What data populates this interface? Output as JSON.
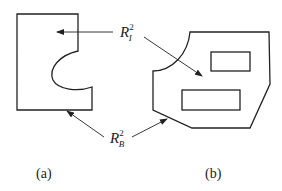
{
  "diagram": {
    "labels": {
      "interior": {
        "main": "R",
        "sub": "I",
        "sup": "2"
      },
      "boundary": {
        "main": "R",
        "sub": "B",
        "sup": "2"
      }
    },
    "captions": {
      "a": "(a)",
      "b": "(b)"
    },
    "colors": {
      "stroke": "#222222",
      "background": "#ffffff"
    }
  }
}
